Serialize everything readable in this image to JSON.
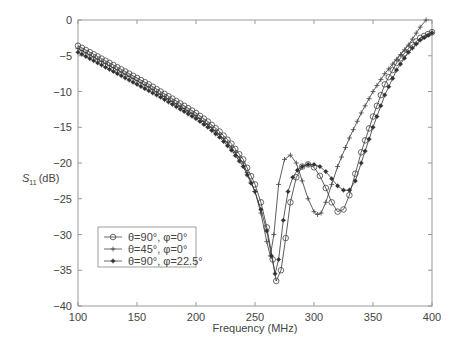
{
  "chart_data": {
    "type": "line",
    "title": "",
    "xlabel": "Frequency (MHz)",
    "ylabel": "S11 (dB)",
    "ylabel_main": "S",
    "ylabel_sub": "11",
    "ylabel_unit": "(dB)",
    "xlim": [
      100,
      400
    ],
    "ylim": [
      -40,
      0
    ],
    "xticks": [
      100,
      150,
      200,
      250,
      300,
      350,
      400
    ],
    "yticks": [
      0,
      -5,
      -10,
      -15,
      -20,
      -25,
      -30,
      -35,
      -40
    ],
    "grid": false,
    "legend_position": "lower left",
    "series": [
      {
        "name": "θ=90°, φ=0°",
        "marker": "circle",
        "x": [
          100,
          110,
          120,
          130,
          140,
          150,
          160,
          170,
          180,
          190,
          200,
          210,
          220,
          230,
          240,
          250,
          255,
          260,
          265,
          268,
          272,
          276,
          280,
          285,
          290,
          295,
          300,
          305,
          310,
          315,
          320,
          325,
          330,
          335,
          340,
          350,
          360,
          370,
          380,
          390,
          400
        ],
        "y": [
          -3.6,
          -4.5,
          -5.4,
          -6.3,
          -7.2,
          -8.1,
          -9.0,
          -10.0,
          -11.0,
          -12.0,
          -13.0,
          -14.2,
          -15.6,
          -17.3,
          -19.5,
          -23.0,
          -25.5,
          -29.0,
          -33.5,
          -36.5,
          -35.0,
          -30.5,
          -25.5,
          -22.0,
          -20.5,
          -20.2,
          -20.6,
          -21.8,
          -23.5,
          -25.5,
          -26.8,
          -26.5,
          -24.5,
          -21.5,
          -18.5,
          -13.5,
          -9.0,
          -6.0,
          -4.0,
          -2.5,
          -1.7
        ]
      },
      {
        "name": "θ=45°, φ=0°",
        "marker": "plus",
        "x": [
          100,
          110,
          120,
          130,
          140,
          150,
          160,
          170,
          180,
          190,
          200,
          210,
          220,
          230,
          240,
          250,
          255,
          260,
          263,
          266,
          270,
          275,
          280,
          285,
          290,
          295,
          300,
          303,
          306,
          310,
          315,
          320,
          330,
          340,
          350,
          360,
          370,
          380,
          390,
          395
        ],
        "y": [
          -4.0,
          -4.9,
          -5.8,
          -6.7,
          -7.6,
          -8.5,
          -9.4,
          -10.4,
          -11.4,
          -12.4,
          -13.4,
          -14.6,
          -16.0,
          -17.8,
          -20.0,
          -24.0,
          -27.0,
          -31.0,
          -33.0,
          -30.0,
          -23.0,
          -19.5,
          -18.9,
          -20.0,
          -22.5,
          -25.0,
          -26.8,
          -27.2,
          -27.0,
          -25.5,
          -23.0,
          -20.5,
          -16.5,
          -13.0,
          -10.0,
          -7.5,
          -5.5,
          -3.5,
          -1.0,
          0.0
        ]
      },
      {
        "name": "θ=90°, φ=22.5°",
        "marker": "star",
        "x": [
          100,
          110,
          120,
          130,
          140,
          150,
          160,
          170,
          180,
          190,
          200,
          210,
          220,
          230,
          240,
          250,
          255,
          260,
          264,
          267,
          270,
          274,
          278,
          282,
          286,
          290,
          295,
          300,
          305,
          310,
          315,
          320,
          325,
          330,
          335,
          340,
          350,
          360,
          370,
          380,
          390,
          400
        ],
        "y": [
          -4.5,
          -5.4,
          -6.3,
          -7.2,
          -8.1,
          -9.0,
          -9.9,
          -10.8,
          -11.8,
          -12.8,
          -13.8,
          -15.0,
          -16.4,
          -18.2,
          -20.5,
          -24.0,
          -26.5,
          -29.5,
          -33.0,
          -35.5,
          -33.5,
          -28.0,
          -24.0,
          -22.0,
          -21.0,
          -20.5,
          -20.2,
          -20.2,
          -20.5,
          -21.2,
          -22.2,
          -23.2,
          -23.8,
          -23.8,
          -22.5,
          -20.0,
          -15.0,
          -10.5,
          -7.0,
          -4.5,
          -2.8,
          -1.8
        ]
      }
    ]
  }
}
